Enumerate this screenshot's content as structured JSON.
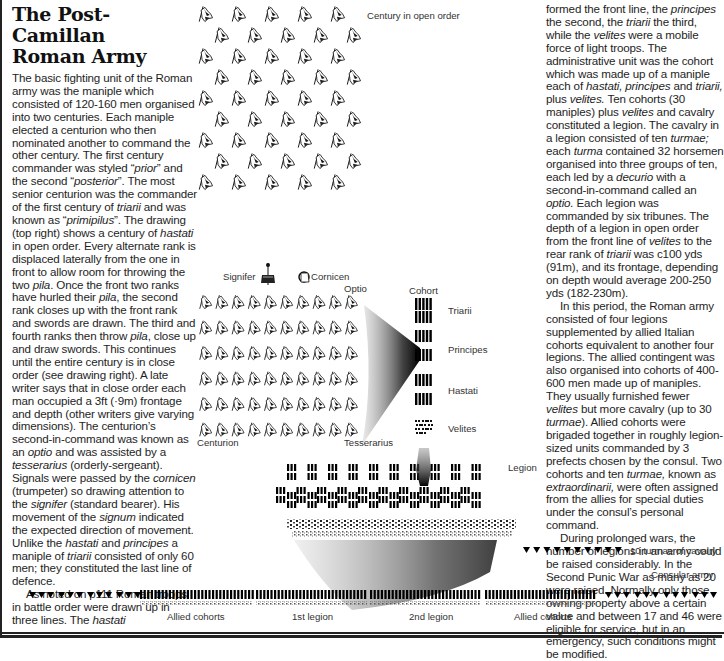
{
  "title_line1": "The Post-Camillan",
  "title_line2": "Roman Army",
  "left_column": [
    {
      "segments": [
        {
          "t": "The basic fighting unit of the Roman army was the maniple which consisted of 120-160 men organised into two centuries. Each maniple elected a centurion who then nominated another to command the other century. The first century commander was styled “"
        },
        {
          "t": "prior",
          "i": true
        },
        {
          "t": "” and the second “"
        },
        {
          "t": "posterior",
          "i": true
        },
        {
          "t": "”. The most senior centurion was the commander of the first century of "
        },
        {
          "t": "triarii",
          "i": true
        },
        {
          "t": " and was known as “"
        },
        {
          "t": "primipilus",
          "i": true
        },
        {
          "t": "”. The drawing (top right) shows a century of "
        },
        {
          "t": "hastati",
          "i": true
        },
        {
          "t": " in open order. Every alternate rank is displaced laterally from the one in front to allow room for throwing the two "
        },
        {
          "t": "pila",
          "i": true
        },
        {
          "t": ". Once the front two ranks have hurled their "
        },
        {
          "t": "pila",
          "i": true
        },
        {
          "t": ", the second rank closes up with the front rank and swords are drawn. The third and fourth ranks then throw "
        },
        {
          "t": "pila",
          "i": true
        },
        {
          "t": ", close up and draw swords. This continues until the entire century is in close order (see drawing right). A late writer says that in close order each man occupied a 3ft (·9m) frontage and depth (other writers give varying dimensions). The centurion’s second-in-command was known as an "
        },
        {
          "t": "optio",
          "i": true
        },
        {
          "t": " and was assisted by a "
        },
        {
          "t": "tesserarius",
          "i": true
        },
        {
          "t": " (orderly-sergeant). Signals were passed by the "
        },
        {
          "t": "cornicen",
          "i": true
        },
        {
          "t": " (trumpeter) so drawing attention to the "
        },
        {
          "t": "signifer",
          "i": true
        },
        {
          "t": " (standard bearer). His movement of the "
        },
        {
          "t": "signum",
          "i": true
        },
        {
          "t": " indicated the expected direction of movement. Unlike the "
        },
        {
          "t": "hastati",
          "i": true
        },
        {
          "t": " and "
        },
        {
          "t": "principes",
          "i": true
        },
        {
          "t": " a maniple of "
        },
        {
          "t": "triarii",
          "i": true
        },
        {
          "t": " consisted of only 60 men; they constituted the last line of defence."
        }
      ]
    },
    {
      "indent": true,
      "segments": [
        {
          "t": "As noted on p111 Roman troops in battle order were drawn up in three lines. The "
        },
        {
          "t": "hastati",
          "i": true
        }
      ]
    }
  ],
  "right_column": [
    {
      "segments": [
        {
          "t": "formed the front line, the "
        },
        {
          "t": "principes",
          "i": true
        },
        {
          "t": " the second, the "
        },
        {
          "t": "triarii",
          "i": true
        },
        {
          "t": " the third, while the "
        },
        {
          "t": "velites",
          "i": true
        },
        {
          "t": " were a mobile force of light troops. The administrative unit was the cohort which was made up of a maniple each of "
        },
        {
          "t": "hastati, principes",
          "i": true
        },
        {
          "t": " and "
        },
        {
          "t": "triarii,",
          "i": true
        },
        {
          "t": " plus "
        },
        {
          "t": "velites.",
          "i": true
        },
        {
          "t": " Ten cohorts (30 maniples) plus "
        },
        {
          "t": "velites",
          "i": true
        },
        {
          "t": " and cavalry constituted a legion. The cavalry in a legion consisted of ten "
        },
        {
          "t": "turmae;",
          "i": true
        },
        {
          "t": " each "
        },
        {
          "t": "turma",
          "i": true
        },
        {
          "t": " contained 32 horsemen organised into three groups of ten, each led by a "
        },
        {
          "t": "decurio",
          "i": true
        },
        {
          "t": " with a second-in-command called an "
        },
        {
          "t": "optio.",
          "i": true
        },
        {
          "t": " Each legion was commanded by six tribunes. The depth of a legion in open order from the front line of "
        },
        {
          "t": "velites",
          "i": true
        },
        {
          "t": " to the rear rank of "
        },
        {
          "t": "triarii",
          "i": true
        },
        {
          "t": " was c100 yds (91m), and its frontage, depending on depth would average 200-250 yds (182-230m)."
        }
      ]
    },
    {
      "indent": true,
      "segments": [
        {
          "t": "In this period, the Roman army consisted of four legions supplemented by allied Italian cohorts equivalent to another four legions. The allied contingent was also organised into cohorts of 400-600 men made up of maniples. They usually furnished fewer "
        },
        {
          "t": "velites",
          "i": true
        },
        {
          "t": " but more cavalry (up to 30 "
        },
        {
          "t": "turmae",
          "i": true
        },
        {
          "t": "). Allied cohorts were brigaded together in roughly legion-sized units commanded by 3 prefects chosen by the consul. Two cohorts and ten "
        },
        {
          "t": "turmae,",
          "i": true
        },
        {
          "t": " known as "
        },
        {
          "t": "extraordinarii,",
          "i": true
        },
        {
          "t": " were often assigned from the allies for special duties under the consul’s personal command."
        }
      ]
    },
    {
      "indent": true,
      "segments": [
        {
          "t": "During prolonged wars, the number of legions in an army could be raised considerably. In the Second Punic War as many as 20 were raised. Normally only those owning property above a certain value and between 17 and 46 were eligible for service, but in an emergency, such conditions might be modified."
        }
      ]
    }
  ],
  "diagram_labels": {
    "century_open_order": "Century in open order",
    "signifer": "Signifer",
    "cornicen": "Cornicen",
    "optio": "Optio",
    "cohort": "Cohort",
    "triarii": "Triarii",
    "principes": "Principes",
    "hastati": "Hastati",
    "velites": "Velites",
    "centurion": "Centurion",
    "tesserarius": "Tesserarius",
    "legion": "Legion",
    "cavalry": "10 turmae of cavalry",
    "consular_army": "Consular army",
    "allied_cohorts_left": "Allied cohorts",
    "first_legion": "1st legion",
    "second_legion": "2nd legion",
    "allied_cohorts_right": "Allied cohorts"
  },
  "formation_counts": {
    "open_order_rows": 9,
    "close_order_rows": 6,
    "close_order_cols": 10,
    "legion_rows": 3,
    "legion_maniples_per_row": 10,
    "cavalry_turmae": 10,
    "flank_turmae_groups": 4
  }
}
